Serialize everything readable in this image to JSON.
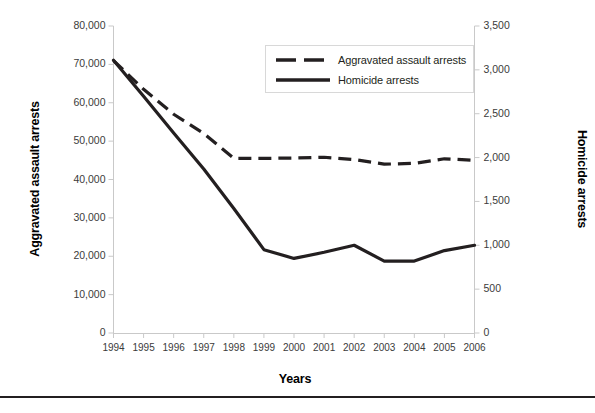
{
  "chart_data": {
    "type": "line",
    "title": "",
    "xlabel": "Years",
    "ylabel": "Aggravated assault arrests",
    "y2label": "Homicide arrests",
    "categories": [
      "1994",
      "1995",
      "1996",
      "1997",
      "1998",
      "1999",
      "2000",
      "2001",
      "2002",
      "2003",
      "2004",
      "2005",
      "2006"
    ],
    "ylim": [
      0,
      80000
    ],
    "y2lim": [
      0,
      3500
    ],
    "yticks": [
      "0",
      "10,000",
      "20,000",
      "30,000",
      "40,000",
      "50,000",
      "60,000",
      "70,000",
      "80,000"
    ],
    "ytick_values": [
      0,
      10000,
      20000,
      30000,
      40000,
      50000,
      60000,
      70000,
      80000
    ],
    "y2ticks": [
      "0",
      "500",
      "1,000",
      "1,500",
      "2,000",
      "2,500",
      "3,000",
      "3,500"
    ],
    "y2tick_values": [
      0,
      500,
      1000,
      1500,
      2000,
      2500,
      3000,
      3500
    ],
    "grid": false,
    "legend_position": "upper right",
    "series": [
      {
        "name": "Aggravated assault arrests",
        "axis": "left",
        "style": "dashed",
        "color": "#231f20",
        "values": [
          71000,
          63500,
          57000,
          52000,
          45500,
          45500,
          45600,
          45800,
          45200,
          44000,
          44200,
          45400,
          45000
        ]
      },
      {
        "name": "Homicide arrests",
        "axis": "right",
        "style": "solid",
        "color": "#231f20",
        "values": [
          3110,
          2700,
          2280,
          1870,
          1420,
          950,
          850,
          920,
          1000,
          820,
          820,
          940,
          1000
        ]
      }
    ]
  },
  "legend": {
    "items": [
      {
        "label": "Aggravated assault arrests",
        "style": "dashed"
      },
      {
        "label": "Homicide arrests",
        "style": "solid"
      }
    ]
  },
  "footer": {
    "caption": ""
  }
}
